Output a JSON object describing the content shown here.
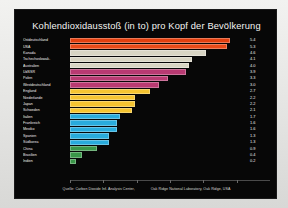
{
  "chart": {
    "title": "Kohlendioxidausstoß (in to) pro Kopf der Bevölkerung",
    "source_left": "Quelle: Carbon Dioxide Inf. Analysis Center,",
    "source_right": "Oak Ridge National Laboratory, Oak Ridge, USA",
    "background_color": "#070707",
    "frame_color": "#e8e8e6",
    "text_color": "#f2f2f0"
  },
  "chart_data": {
    "type": "bar",
    "orientation": "horizontal",
    "title": "Kohlendioxidausstoß (in to) pro Kopf der Bevölkerung",
    "xlabel": "",
    "ylabel": "",
    "xlim": [
      0,
      6
    ],
    "grid": false,
    "legend": "none",
    "unit": "to CO2 pro Kopf",
    "categories": [
      "Ostdeutschland",
      "USA",
      "Kanada",
      "Tschechoslowak.",
      "Australien",
      "UdSSR",
      "Polen",
      "Westdeutschland",
      "England",
      "Niederlande",
      "Japan",
      "Schweden",
      "Italien",
      "Frankreich",
      "Mexiko",
      "Spanien",
      "Südkorea",
      "China",
      "Brasilien",
      "Indien"
    ],
    "values": [
      5.4,
      5.3,
      4.6,
      4.1,
      4.0,
      3.9,
      3.3,
      3.0,
      2.7,
      2.2,
      2.2,
      2.1,
      1.7,
      1.6,
      1.6,
      1.3,
      1.3,
      0.9,
      0.4,
      0.2
    ],
    "bar_colors": [
      "#e2400f",
      "#e84a18",
      "#d8d5c4",
      "#d8d5c4",
      "#d8d5c4",
      "#b83a72",
      "#b83a72",
      "#b83a72",
      "#f5c431",
      "#f5c431",
      "#f5c431",
      "#f5c431",
      "#29abdc",
      "#29abdc",
      "#29abdc",
      "#29abdc",
      "#29abdc",
      "#3a9648",
      "#3a9648",
      "#3a9648"
    ],
    "axis_ticks": [
      0,
      1,
      2,
      3,
      4,
      5
    ]
  }
}
